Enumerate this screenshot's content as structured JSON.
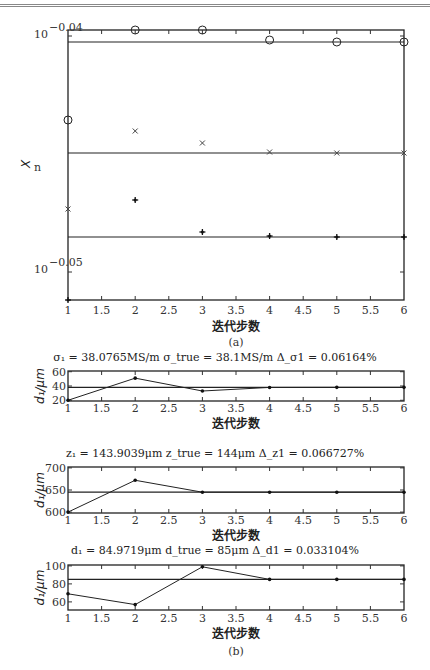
{
  "figure": {
    "caption_a": "(a)",
    "caption_b": "(b)",
    "xlabel": "迭代步数"
  },
  "chart_data": [
    {
      "id": "a",
      "type": "scatter",
      "title": "",
      "xlabel": "迭代步数",
      "ylabel": "X_n",
      "yscale": "log",
      "ytick_labels": [
        "10^-0.04",
        "10^-0.05"
      ],
      "xtick_labels": [
        "1",
        "1.5",
        "2",
        "2.5",
        "3",
        "3.5",
        "4",
        "4.5",
        "5",
        "5.5",
        "6"
      ],
      "xlim": [
        1,
        6
      ],
      "series": [
        {
          "name": "circle",
          "marker": "o",
          "x": [
            1,
            2,
            3,
            4,
            5,
            6
          ],
          "y_px": [
            120,
            30,
            30,
            40,
            42,
            42
          ],
          "reference_y_px": 42
        },
        {
          "name": "cross",
          "marker": "x",
          "x": [
            1,
            2,
            3,
            4,
            5,
            6
          ],
          "y_px": [
            209,
            131,
            143,
            152,
            153,
            153
          ],
          "reference_y_px": 153
        },
        {
          "name": "star",
          "marker": "*",
          "x": [
            1,
            2,
            3,
            4,
            5,
            6
          ],
          "y_px": [
            300,
            200,
            232,
            236,
            237,
            237
          ],
          "reference_y_px": 237
        }
      ]
    },
    {
      "id": "b1",
      "type": "line",
      "title": "σ1 = 38.0765MS/m   σtrue = 38.1MS/m   Δσ1 = 0.06164%",
      "title_parts": {
        "est": "σ₁ = 38.0765MS/m",
        "true": "σ_true = 38.1MS/m",
        "err": "Δ_σ1 = 0.06164%"
      },
      "xlabel": "迭代步数",
      "ylabel": "σ₁/μm",
      "ylabel_display": "d₁/μm",
      "xtick_labels": [
        "1",
        "1.5",
        "2",
        "2.5",
        "3",
        "3.5",
        "4",
        "4.5",
        "5",
        "5.5",
        "6"
      ],
      "ytick_labels": [
        "20",
        "40",
        "60"
      ],
      "ylim": [
        19,
        61
      ],
      "x": [
        1,
        2,
        3,
        4,
        5,
        6
      ],
      "values": [
        20,
        51,
        33,
        38,
        38.1,
        38.1
      ],
      "reference": 38.1
    },
    {
      "id": "b2",
      "type": "line",
      "title": "z1 = 143.9039μm   ztrue = 144μm   Δz1 = 0.066727%",
      "title_parts": {
        "est": "z₁ = 143.9039μm",
        "true": "z_true = 144μm",
        "err": "Δ_z1 = 0.066727%"
      },
      "xlabel": "迭代步数",
      "ylabel": "d₁/μm",
      "xtick_labels": [
        "1",
        "1.5",
        "2",
        "2.5",
        "3",
        "3.5",
        "4",
        "4.5",
        "5",
        "5.5",
        "6"
      ],
      "ytick_labels": [
        "600",
        "650",
        "700"
      ],
      "ylim": [
        598,
        702
      ],
      "x": [
        1,
        2,
        3,
        4,
        5,
        6
      ],
      "values": [
        600,
        672,
        645,
        645,
        645,
        645
      ],
      "reference": 645
    },
    {
      "id": "b3",
      "type": "line",
      "title": "d1 = 84.9719μm   dtrue = 85μm   Δd1 = 0.033104%",
      "title_parts": {
        "est": "d₁ = 84.9719μm",
        "true": "d_true = 85μm",
        "err": "Δ_d1 = 0.033104%"
      },
      "xlabel": "迭代步数",
      "ylabel": "d₁/μm",
      "xtick_labels": [
        "1",
        "1.5",
        "2",
        "2.5",
        "3",
        "3.5",
        "4",
        "4.5",
        "5",
        "5.5",
        "6"
      ],
      "ytick_labels": [
        "60",
        "80",
        "100"
      ],
      "ylim": [
        51,
        101
      ],
      "x": [
        1,
        2,
        3,
        4,
        5,
        6
      ],
      "values": [
        69,
        57,
        99,
        85,
        85,
        85
      ],
      "reference": 85
    }
  ]
}
